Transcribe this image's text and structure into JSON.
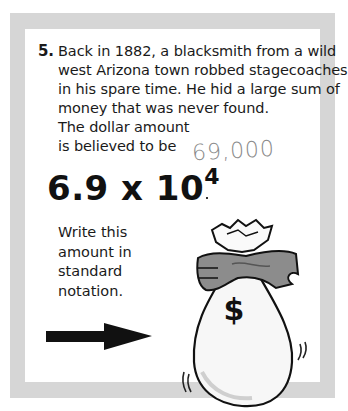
{
  "problem": {
    "number": "5.",
    "lines": [
      "Back in 1882, a blacksmith from a wild",
      "west Arizona town robbed stagecoaches",
      "in his spare time. He hid a large sum of",
      "money that was never found.",
      "The dollar amount",
      "is believed to be"
    ]
  },
  "handwritten_answer": "69,000",
  "expression": {
    "coefficient": "6.9",
    "operator": "x",
    "base": "10",
    "exponent": "4"
  },
  "instruction": {
    "lines": [
      "Write this",
      "amount in",
      "standard",
      "notation."
    ]
  },
  "illustration": {
    "arrow": "right-arrow-icon",
    "bag_symbol": "$",
    "colors": {
      "frame": "#d6d6d6",
      "panel": "#ffffff",
      "ink": "#111111",
      "pencil": "#8a8a8a"
    }
  }
}
